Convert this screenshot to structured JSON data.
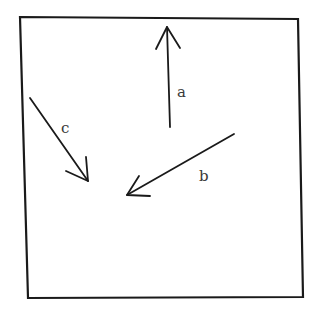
{
  "diagram": {
    "type": "vector-arrows-in-box",
    "frame": {
      "corners": [
        [
          20,
          17
        ],
        [
          298,
          19
        ],
        [
          303,
          297
        ],
        [
          28,
          298
        ]
      ],
      "stroke": "#1a1a1a"
    },
    "arrows": [
      {
        "id": "a",
        "label": "a",
        "tail": [
          170,
          127
        ],
        "tip": [
          167,
          27
        ],
        "wings": [
          [
            156,
            49
          ],
          [
            180,
            48
          ]
        ],
        "label_pos": [
          177,
          97
        ],
        "direction": "up"
      },
      {
        "id": "b",
        "label": "b",
        "tail": [
          234,
          134
        ],
        "tip": [
          127,
          195
        ],
        "wings": [
          [
            139,
            176
          ],
          [
            150,
            196
          ]
        ],
        "label_pos": [
          199,
          181
        ],
        "direction": "down-left"
      },
      {
        "id": "c",
        "label": "c",
        "tail": [
          30,
          98
        ],
        "tip": [
          88,
          181
        ],
        "wings": [
          [
            86,
            157
          ],
          [
            66,
            171
          ]
        ],
        "label_pos": [
          61,
          133
        ],
        "direction": "down-right"
      }
    ]
  }
}
